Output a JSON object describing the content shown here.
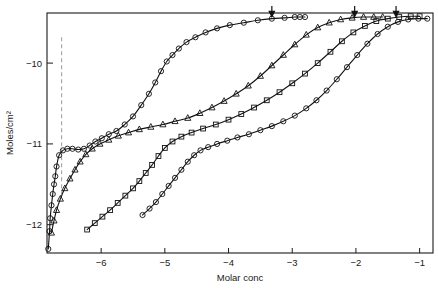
{
  "chart_data": {
    "type": "line",
    "title": "",
    "xlabel": "Molar conc",
    "ylabel": "Moles/cm2",
    "ylabel_display": "Moles/cm²",
    "xlim": [
      -6.85,
      -0.79
    ],
    "ylim": [
      -12.35,
      -9.38
    ],
    "xticks": [
      -6,
      -5,
      -4,
      -3,
      -2,
      -1
    ],
    "xtick_labels": [
      "−6",
      "−5",
      "−4",
      "−3",
      "−2",
      "−1"
    ],
    "yticks": [
      -10,
      -11,
      -12
    ],
    "ytick_labels": [
      "−10",
      "−11",
      "−12"
    ],
    "grid": false,
    "legend": "none",
    "annotations": {
      "arrows": [
        {
          "name": "cmc-arrow-1",
          "x": -3.32,
          "y": -9.45,
          "direction": "down"
        },
        {
          "name": "cmc-arrow-2",
          "x": -2.02,
          "y": -9.45,
          "direction": "down"
        },
        {
          "name": "cmc-arrow-3",
          "x": -1.37,
          "y": -9.45,
          "direction": "down"
        }
      ],
      "dashed_lines": [
        {
          "name": "reference-line",
          "x": -6.62,
          "y0": -9.68,
          "y1": -11.62,
          "style": "dashed"
        }
      ]
    },
    "series": [
      {
        "name": "curve-1",
        "marker": "circle",
        "points": [
          [
            -6.83,
            -12.3
          ],
          [
            -6.81,
            -12.08
          ],
          [
            -6.8,
            -11.92
          ],
          [
            -6.78,
            -11.76
          ],
          [
            -6.76,
            -11.62
          ],
          [
            -6.74,
            -11.5
          ],
          [
            -6.72,
            -11.4
          ],
          [
            -6.7,
            -11.28
          ],
          [
            -6.66,
            -11.14
          ],
          [
            -6.6,
            -11.08
          ],
          [
            -6.53,
            -11.06
          ],
          [
            -6.45,
            -11.06
          ],
          [
            -6.36,
            -11.07
          ],
          [
            -6.27,
            -11.06
          ],
          [
            -6.18,
            -11.02
          ],
          [
            -6.09,
            -10.97
          ],
          [
            -5.99,
            -10.93
          ],
          [
            -5.88,
            -10.88
          ],
          [
            -5.76,
            -10.84
          ],
          [
            -5.63,
            -10.76
          ],
          [
            -5.5,
            -10.66
          ],
          [
            -5.37,
            -10.52
          ],
          [
            -5.25,
            -10.38
          ],
          [
            -5.15,
            -10.24
          ],
          [
            -5.06,
            -10.1
          ],
          [
            -4.97,
            -9.98
          ],
          [
            -4.88,
            -9.9
          ],
          [
            -4.78,
            -9.82
          ],
          [
            -4.66,
            -9.74
          ],
          [
            -4.52,
            -9.68
          ],
          [
            -4.36,
            -9.62
          ],
          [
            -4.18,
            -9.57
          ],
          [
            -3.98,
            -9.53
          ],
          [
            -3.76,
            -9.5
          ],
          [
            -3.54,
            -9.47
          ],
          [
            -3.32,
            -9.45
          ],
          [
            -3.12,
            -9.44
          ],
          [
            -2.96,
            -9.43
          ],
          [
            -2.88,
            -9.43
          ],
          [
            -2.8,
            -9.43
          ]
        ]
      },
      {
        "name": "curve-2",
        "marker": "triangle",
        "points": [
          [
            -6.78,
            -12.1
          ],
          [
            -6.74,
            -11.95
          ],
          [
            -6.7,
            -11.82
          ],
          [
            -6.64,
            -11.68
          ],
          [
            -6.57,
            -11.55
          ],
          [
            -6.49,
            -11.43
          ],
          [
            -6.41,
            -11.32
          ],
          [
            -6.33,
            -11.22
          ],
          [
            -6.24,
            -11.13
          ],
          [
            -6.14,
            -11.06
          ],
          [
            -6.02,
            -11.0
          ],
          [
            -5.88,
            -10.95
          ],
          [
            -5.73,
            -10.9
          ],
          [
            -5.57,
            -10.86
          ],
          [
            -5.4,
            -10.82
          ],
          [
            -5.22,
            -10.79
          ],
          [
            -5.03,
            -10.76
          ],
          [
            -4.84,
            -10.72
          ],
          [
            -4.64,
            -10.68
          ],
          [
            -4.45,
            -10.62
          ],
          [
            -4.26,
            -10.55
          ],
          [
            -4.07,
            -10.47
          ],
          [
            -3.88,
            -10.38
          ],
          [
            -3.69,
            -10.28
          ],
          [
            -3.5,
            -10.16
          ],
          [
            -3.32,
            -10.03
          ],
          [
            -3.14,
            -9.9
          ],
          [
            -2.96,
            -9.77
          ],
          [
            -2.78,
            -9.65
          ],
          [
            -2.6,
            -9.56
          ],
          [
            -2.42,
            -9.5
          ],
          [
            -2.24,
            -9.46
          ],
          [
            -2.06,
            -9.44
          ],
          [
            -1.88,
            -9.43
          ],
          [
            -1.72,
            -9.43
          ],
          [
            -1.58,
            -9.43
          ]
        ]
      },
      {
        "name": "curve-3",
        "marker": "square",
        "points": [
          [
            -6.22,
            -12.06
          ],
          [
            -6.1,
            -11.98
          ],
          [
            -5.98,
            -11.9
          ],
          [
            -5.86,
            -11.82
          ],
          [
            -5.74,
            -11.73
          ],
          [
            -5.62,
            -11.64
          ],
          [
            -5.5,
            -11.55
          ],
          [
            -5.4,
            -11.46
          ],
          [
            -5.3,
            -11.36
          ],
          [
            -5.2,
            -11.26
          ],
          [
            -5.1,
            -11.15
          ],
          [
            -5.0,
            -11.05
          ],
          [
            -4.88,
            -10.97
          ],
          [
            -4.74,
            -10.91
          ],
          [
            -4.58,
            -10.86
          ],
          [
            -4.4,
            -10.81
          ],
          [
            -4.2,
            -10.76
          ],
          [
            -4.0,
            -10.7
          ],
          [
            -3.8,
            -10.63
          ],
          [
            -3.6,
            -10.55
          ],
          [
            -3.4,
            -10.46
          ],
          [
            -3.2,
            -10.36
          ],
          [
            -3.0,
            -10.25
          ],
          [
            -2.8,
            -10.13
          ],
          [
            -2.6,
            -10.0
          ],
          [
            -2.4,
            -9.86
          ],
          [
            -2.22,
            -9.73
          ],
          [
            -2.04,
            -9.62
          ],
          [
            -1.86,
            -9.54
          ],
          [
            -1.68,
            -9.48
          ],
          [
            -1.5,
            -9.45
          ],
          [
            -1.32,
            -9.43
          ],
          [
            -1.14,
            -9.42
          ],
          [
            -1.0,
            -9.42
          ]
        ]
      },
      {
        "name": "curve-4",
        "marker": "circle",
        "points": [
          [
            -5.35,
            -11.88
          ],
          [
            -5.24,
            -11.8
          ],
          [
            -5.14,
            -11.72
          ],
          [
            -5.04,
            -11.62
          ],
          [
            -4.94,
            -11.52
          ],
          [
            -4.84,
            -11.42
          ],
          [
            -4.74,
            -11.32
          ],
          [
            -4.64,
            -11.22
          ],
          [
            -4.54,
            -11.14
          ],
          [
            -4.44,
            -11.08
          ],
          [
            -4.32,
            -11.04
          ],
          [
            -4.18,
            -11.0
          ],
          [
            -4.02,
            -10.96
          ],
          [
            -3.86,
            -10.92
          ],
          [
            -3.68,
            -10.88
          ],
          [
            -3.5,
            -10.83
          ],
          [
            -3.32,
            -10.78
          ],
          [
            -3.14,
            -10.72
          ],
          [
            -2.96,
            -10.65
          ],
          [
            -2.78,
            -10.56
          ],
          [
            -2.62,
            -10.46
          ],
          [
            -2.46,
            -10.34
          ],
          [
            -2.3,
            -10.2
          ],
          [
            -2.14,
            -10.05
          ],
          [
            -1.98,
            -9.9
          ],
          [
            -1.82,
            -9.76
          ],
          [
            -1.66,
            -9.64
          ],
          [
            -1.5,
            -9.55
          ],
          [
            -1.34,
            -9.49
          ],
          [
            -1.18,
            -9.46
          ],
          [
            -1.02,
            -9.45
          ],
          [
            -0.88,
            -9.45
          ]
        ]
      }
    ]
  },
  "axes": {
    "x_title": "Molar conc",
    "y_title": "Moles/cm²"
  },
  "colors": {
    "ink": "#111111",
    "dashed": "#9a9a9a",
    "background": "#ffffff"
  }
}
